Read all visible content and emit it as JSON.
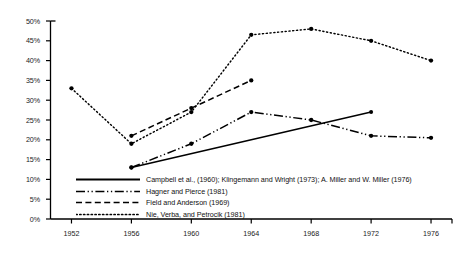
{
  "chart_data": {
    "type": "line",
    "title": "",
    "xlabel": "",
    "ylabel": "",
    "x": [
      1952,
      1956,
      1960,
      1964,
      1968,
      1972,
      1976
    ],
    "xlim": [
      1950.6,
      1977.4
    ],
    "ylim": [
      0,
      50
    ],
    "ytick_labels": [
      "0%",
      "5%",
      "10%",
      "15%",
      "20%",
      "25%",
      "30%",
      "35%",
      "40%",
      "45%",
      "50%"
    ],
    "ytick_values": [
      0,
      5,
      10,
      15,
      20,
      25,
      30,
      35,
      40,
      45,
      50
    ],
    "xtick_labels": [
      "1952",
      "1956",
      "1960",
      "1964",
      "1968",
      "1972",
      "1976"
    ],
    "grid": false,
    "legend_position": "inside-lower-left",
    "series": [
      {
        "name": "Campbell et al., (1960); Klingemann and Wright (1973); A. Miller and W. Miller (1976)",
        "style": "solid",
        "color": "#000000",
        "x": [
          1956,
          1972
        ],
        "values": [
          13,
          27
        ]
      },
      {
        "name": "Hagner and Pierce (1981)",
        "style": "dash-dot-dot",
        "color": "#000000",
        "x": [
          1956,
          1960,
          1964,
          1968,
          1972,
          1976
        ],
        "values": [
          13,
          19,
          27,
          25,
          21,
          20.5
        ]
      },
      {
        "name": "Field and Anderson (1969)",
        "style": "dashed",
        "color": "#000000",
        "x": [
          1956,
          1960,
          1964
        ],
        "values": [
          21,
          28,
          35
        ]
      },
      {
        "name": "Nie, Verba, and Petrocik (1981)",
        "style": "dotted",
        "color": "#000000",
        "x": [
          1952,
          1956,
          1960,
          1964,
          1968,
          1972,
          1976
        ],
        "values": [
          33,
          19,
          27,
          46.5,
          48,
          45,
          40
        ]
      }
    ]
  },
  "legend": {
    "items": [
      {
        "label": "Campbell et al., (1960); Klingemann and Wright (1973); A. Miller and W. Miller (1976)",
        "style": "solid"
      },
      {
        "label": "Hagner and Pierce (1981)",
        "style": "dash-dot-dot"
      },
      {
        "label": "Field and Anderson (1969)",
        "style": "dashed"
      },
      {
        "label": "Nie, Verba, and Petrocik (1981)",
        "style": "dotted"
      }
    ]
  }
}
